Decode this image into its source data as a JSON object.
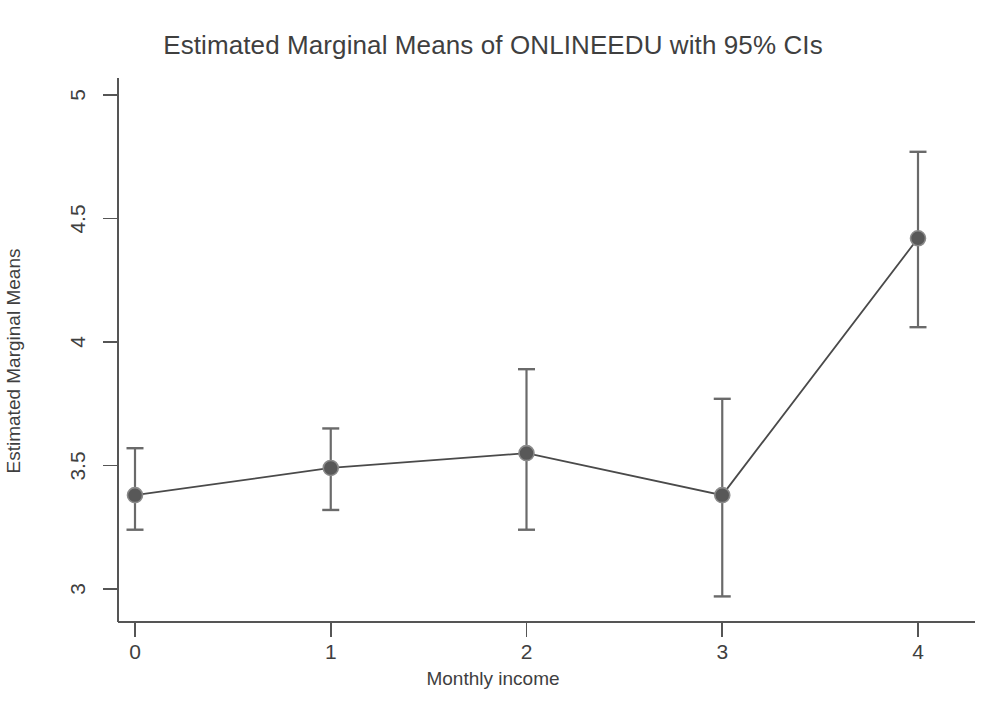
{
  "chart_data": {
    "type": "line",
    "title": "Estimated Marginal Means of ONLINEEDU with 95% CIs",
    "xlabel": "Monthly income",
    "ylabel": "Estimated Marginal Means",
    "x": [
      0,
      1,
      2,
      3,
      4
    ],
    "xtick_labels": [
      "0",
      "1",
      "2",
      "3",
      "4"
    ],
    "ytick_labels": [
      "3",
      "3.5",
      "4",
      "4.5",
      "5"
    ],
    "ytick_values": [
      3,
      3.5,
      4,
      4.5,
      5
    ],
    "xlim": [
      -0.22,
      4.3
    ],
    "ylim": [
      2.88,
      5.05
    ],
    "grid": false,
    "legend": null,
    "error_bar_type": "95% CI",
    "series": [
      {
        "name": "ONLINEEDU estimated marginal mean",
        "values": [
          3.38,
          3.49,
          3.55,
          3.38,
          4.42
        ],
        "ci_upper": [
          3.57,
          3.65,
          3.89,
          3.77,
          4.77
        ],
        "ci_lower": [
          3.24,
          3.32,
          3.24,
          2.97,
          4.06
        ],
        "line_color": "#4a4a4a",
        "marker_color": "#585858",
        "errorbar_color": "#6a6a6a"
      }
    ],
    "annotations": []
  },
  "colors": {
    "background": "#ffffff",
    "axis": "#555555",
    "text": "#3f3f3f",
    "accent": "#585858"
  }
}
